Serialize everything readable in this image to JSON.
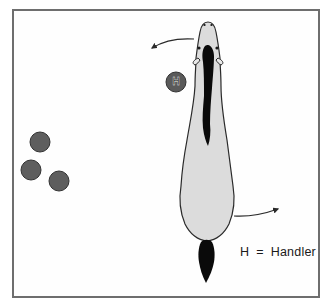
{
  "diagram": {
    "type": "horse-handling-positions",
    "frame": {
      "border_color": "#6e6e6e"
    },
    "horse": {
      "orientation": "top-down, head facing up",
      "body_color": "#dcdcdc",
      "outline_color": "#2a2a2a",
      "mane_color": "#0a0a0a",
      "tail_color": "#0a0a0a"
    },
    "handler": {
      "symbol": "H",
      "fill": "#5a5a5a"
    },
    "other_people": {
      "count": 3,
      "fill": "#5e5e5e"
    },
    "arrows": [
      {
        "name": "head-turn-arrow",
        "direction": "left, curving away from head"
      },
      {
        "name": "hindquarters-arrow",
        "direction": "right, curving away from hindquarters"
      }
    ],
    "legend": {
      "symbol": "H",
      "equals": "=",
      "meaning": "Handler"
    }
  }
}
